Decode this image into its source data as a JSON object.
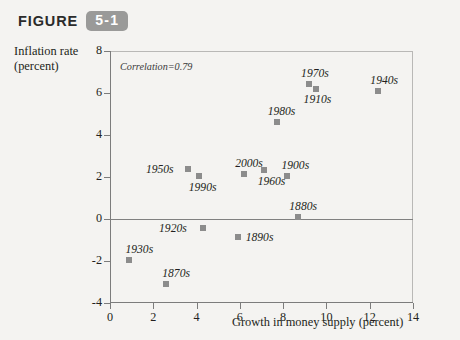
{
  "figure": {
    "word": "FIGURE",
    "number": "5-1"
  },
  "chart_data": {
    "type": "scatter",
    "title": "",
    "xlabel": "Growth in money supply (percent)",
    "ylabel": "Inflation rate (percent)",
    "ylabel_line1": "Inflation rate",
    "ylabel_line2": "(percent)",
    "xlim": [
      0,
      14
    ],
    "ylim": [
      -4,
      8
    ],
    "xticks": [
      "0",
      "2",
      "4",
      "6",
      "8",
      "10",
      "12",
      "14"
    ],
    "yticks": [
      "8",
      "6",
      "4",
      "2",
      "0",
      "-2",
      "-4"
    ],
    "grid": false,
    "legend": "none",
    "annotation": "Correlation=0.79",
    "zero_line": 0,
    "marker_color": "#8c8c8c",
    "axis_color": "#7c7c7c",
    "points": [
      {
        "label": "1930s",
        "x": 0.9,
        "y": -1.95,
        "lx": -4,
        "ly": -17
      },
      {
        "label": "1870s",
        "x": 2.6,
        "y": -3.1,
        "lx": -4,
        "ly": -17
      },
      {
        "label": "1950s",
        "x": 3.6,
        "y": 2.4,
        "lx": -42,
        "ly": -6
      },
      {
        "label": "1990s",
        "x": 4.1,
        "y": 2.05,
        "lx": -10,
        "ly": 5
      },
      {
        "label": "1920s",
        "x": 4.3,
        "y": -0.45,
        "lx": -44,
        "ly": -6
      },
      {
        "label": "1890s",
        "x": 5.9,
        "y": -0.85,
        "lx": 8,
        "ly": -6
      },
      {
        "label": "2000s",
        "x": 6.2,
        "y": 2.15,
        "lx": -9,
        "ly": -17
      },
      {
        "label": "1960s",
        "x": 7.1,
        "y": 2.35,
        "lx": -6,
        "ly": 5
      },
      {
        "label": "1980s",
        "x": 7.7,
        "y": 4.6,
        "lx": -9,
        "ly": -17
      },
      {
        "label": "1900s",
        "x": 8.2,
        "y": 2.05,
        "lx": -6,
        "ly": -17
      },
      {
        "label": "1880s",
        "x": 8.7,
        "y": 0.1,
        "lx": -9,
        "ly": -17
      },
      {
        "label": "1910s",
        "x": 9.5,
        "y": 6.2,
        "lx": -12,
        "ly": 4
      },
      {
        "label": "1970s",
        "x": 9.2,
        "y": 6.45,
        "lx": -8,
        "ly": -17
      },
      {
        "label": "1940s",
        "x": 12.4,
        "y": 6.1,
        "lx": -8,
        "ly": -17
      }
    ]
  }
}
